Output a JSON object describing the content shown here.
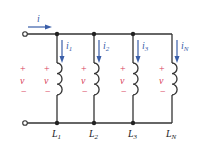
{
  "diagram": {
    "source_current": "i",
    "source_polarity": {
      "plus": "+",
      "minus": "−",
      "voltage": "v"
    },
    "branches": [
      {
        "label": "L",
        "sub": "1",
        "current": "i",
        "current_sub": "1",
        "plus": "+",
        "minus": "−",
        "voltage": "v",
        "x": 57
      },
      {
        "label": "L",
        "sub": "2",
        "current": "i",
        "current_sub": "2",
        "plus": "+",
        "minus": "−",
        "voltage": "v",
        "x": 94
      },
      {
        "label": "L",
        "sub": "3",
        "current": "i",
        "current_sub": "3",
        "plus": "+",
        "minus": "−",
        "voltage": "v",
        "x": 133
      },
      {
        "label": "L",
        "sub": "N",
        "current": "i",
        "current_sub": "N",
        "plus": "+",
        "minus": "−",
        "voltage": "v",
        "x": 172
      }
    ],
    "colors": {
      "wire": "#333333",
      "arrow": "#3a5ea8",
      "polarity": "#d8405a",
      "label": "#222222"
    }
  }
}
